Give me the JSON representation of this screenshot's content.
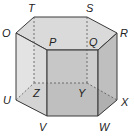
{
  "diagram": {
    "type": "hexagonal-prism",
    "labels": {
      "T": "T",
      "S": "S",
      "R": "R",
      "Q": "Q",
      "P": "P",
      "O": "O",
      "U": "U",
      "V": "V",
      "W": "W",
      "X": "X",
      "Y": "Y",
      "Z": "Z"
    },
    "colors": {
      "edge": "#3a3a3a",
      "top_face": "#d8d8d8",
      "front_face": "#c4c4c4",
      "left_face": "#dcdcdc",
      "right_face": "#b8b8b8",
      "bottom_face": "#9a9a9a",
      "back_face": "#d0d0d0"
    }
  }
}
